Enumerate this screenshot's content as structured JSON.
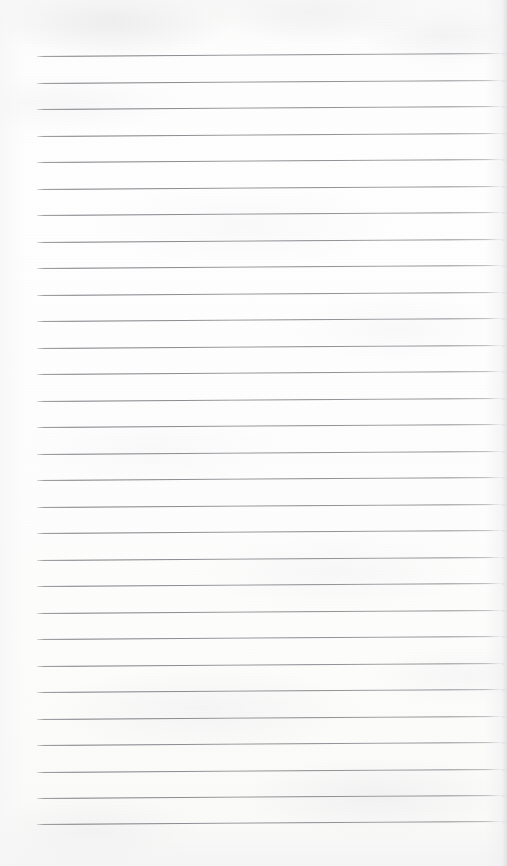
{
  "document": {
    "kind": "scanned-lined-notebook-page",
    "description": "Blank ruled paper page scan",
    "page_width": 507,
    "page_height": 866,
    "background_color": "#fdfdfc",
    "has_text_content": false,
    "text_content": ""
  },
  "ruling": {
    "line_color": "#7c7c82",
    "line_thickness_px": 1,
    "line_count": 30,
    "line_spacing_px": 26.2,
    "first_line_y": 56,
    "last_line_y": 824,
    "line_start_x": 37,
    "line_end_x": 503,
    "line_length_px": 466,
    "skew_degrees": -0.37,
    "left_margin_px": 37,
    "right_margin_px": 4,
    "top_margin_px": 56,
    "bottom_margin_px": 42,
    "lines_y": [
      56.0,
      82.5,
      109.0,
      135.5,
      162.0,
      188.5,
      215.0,
      241.5,
      268.0,
      294.5,
      321.0,
      347.5,
      374.0,
      400.5,
      427.0,
      453.5,
      480.0,
      506.5,
      533.0,
      559.5,
      586.0,
      612.5,
      639.0,
      665.5,
      692.0,
      718.5,
      745.0,
      771.5,
      798.0,
      824.0
    ]
  },
  "scan_artifacts": {
    "right_edge_shadow_color": "#d6d6d9",
    "paper_tint": "#fdfdfd",
    "mottle_color": "#ececed",
    "vignette_color": "#f4f4f5"
  }
}
